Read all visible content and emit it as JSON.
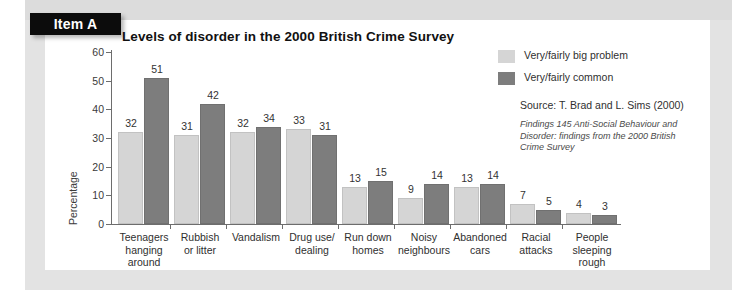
{
  "item_tab": {
    "label": "Item A"
  },
  "chart_data": {
    "type": "bar",
    "title": "Levels of disorder in the 2000 British Crime Survey",
    "xlabel": "",
    "ylabel": "Percentage",
    "ylim": [
      0,
      60
    ],
    "yticks": [
      0,
      10,
      20,
      30,
      40,
      50,
      60
    ],
    "grid": false,
    "legend_position": "right",
    "categories": [
      "Teenagers hanging around",
      "Rubbish or litter",
      "Vandalism",
      "Drug use/ dealing",
      "Run down homes",
      "Noisy neighbours",
      "Abandoned cars",
      "Racial attacks",
      "People sleeping rough"
    ],
    "category_lines": [
      [
        "Teenagers",
        "hanging",
        "around"
      ],
      [
        "Rubbish",
        "or litter"
      ],
      [
        "Vandalism"
      ],
      [
        "Drug use/",
        "dealing"
      ],
      [
        "Run down",
        "homes"
      ],
      [
        "Noisy",
        "neighbours"
      ],
      [
        "Abandoned",
        "cars"
      ],
      [
        "Racial",
        "attacks"
      ],
      [
        "People",
        "sleeping",
        "rough"
      ]
    ],
    "series": [
      {
        "name": "Very/fairly big problem",
        "color": "#d5d5d5",
        "values": [
          32,
          31,
          32,
          33,
          13,
          9,
          13,
          7,
          4
        ]
      },
      {
        "name": "Very/fairly common",
        "color": "#7d7d7d",
        "values": [
          51,
          42,
          34,
          31,
          15,
          14,
          14,
          5,
          3
        ]
      }
    ]
  },
  "legend": [
    {
      "label": "Very/fairly big problem",
      "swatch": "light"
    },
    {
      "label": "Very/fairly common",
      "swatch": "dark"
    }
  ],
  "source": {
    "line": "Source: T. Brad and L. Sims (2000)",
    "note_lines": [
      "Findings 145 Anti-Social Behaviour and",
      "Disorder: findings from the 2000 British",
      "Crime Survey"
    ]
  }
}
